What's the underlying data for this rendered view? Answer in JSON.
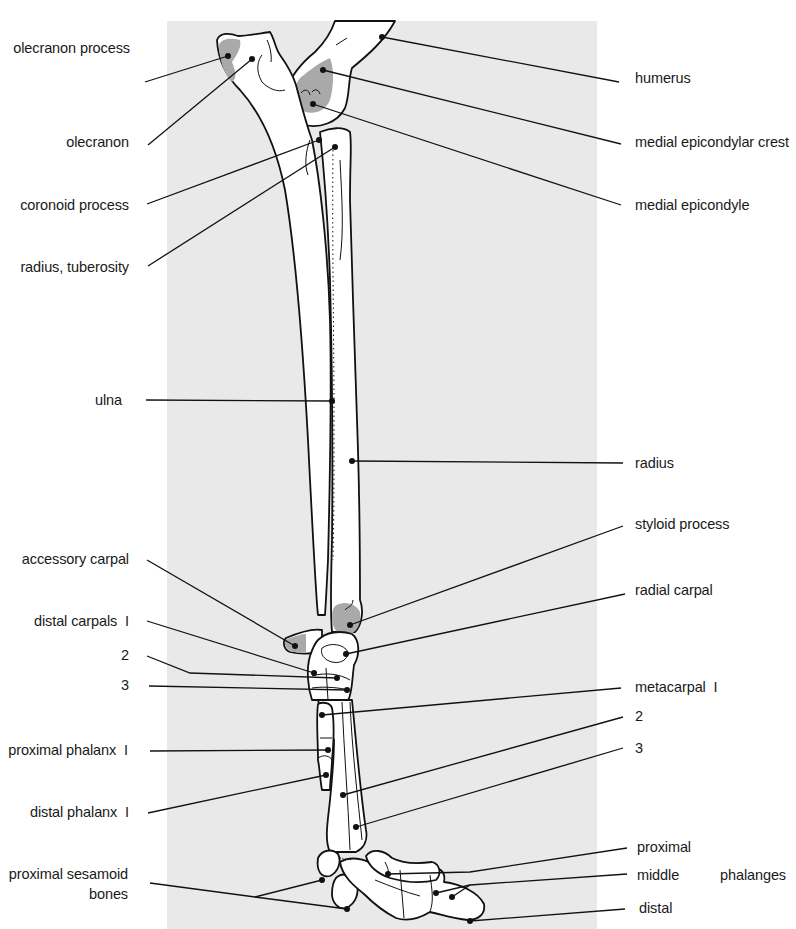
{
  "diagram": {
    "colors": {
      "background_panel": "#e9e9e9",
      "bone_fill": "#ffffff",
      "shaded_region": "#a9a9a9",
      "outline": "#111111"
    },
    "labels_left": [
      {
        "id": "olecranon-process",
        "text": "olecranon process",
        "x": 5,
        "y": 40,
        "w": 125
      },
      {
        "id": "olecranon",
        "text": "olecranon",
        "x": 5,
        "y": 134,
        "w": 124
      },
      {
        "id": "coronoid-process",
        "text": "coronoid process",
        "x": 5,
        "y": 197,
        "w": 124
      },
      {
        "id": "radius-tuberosity",
        "text": "radius, tuberosity",
        "x": 5,
        "y": 259,
        "w": 124
      },
      {
        "id": "ulna",
        "text": "ulna",
        "x": 5,
        "y": 392,
        "w": 117
      },
      {
        "id": "accessory-carpal",
        "text": "accessory carpal",
        "x": 5,
        "y": 551,
        "w": 124
      },
      {
        "id": "distal-carpals-1",
        "text": "distal carpals  I",
        "x": 5,
        "y": 613,
        "w": 124
      },
      {
        "id": "distal-carpals-2",
        "text": "2",
        "x": 5,
        "y": 647,
        "w": 124
      },
      {
        "id": "distal-carpals-3",
        "text": "3",
        "x": 5,
        "y": 677,
        "w": 124
      },
      {
        "id": "proximal-phalanx-1",
        "text": "proximal phalanx  I",
        "x": 0,
        "y": 742,
        "w": 128
      },
      {
        "id": "distal-phalanx-1",
        "text": "distal phalanx  I",
        "x": 5,
        "y": 804,
        "w": 124
      },
      {
        "id": "proximal-sesamoid-bones",
        "text": "proximal sesamoid",
        "x": 0,
        "y": 866,
        "w": 128
      },
      {
        "id": "proximal-sesamoid-bones-2",
        "text": "bones",
        "x": 0,
        "y": 886,
        "w": 128
      }
    ],
    "labels_right": [
      {
        "id": "humerus",
        "text": "humerus",
        "x": 635,
        "y": 70
      },
      {
        "id": "medial-epicondylar-crest",
        "text": "medial epicondylar crest",
        "x": 635,
        "y": 134
      },
      {
        "id": "medial-epicondyle",
        "text": "medial epicondyle",
        "x": 635,
        "y": 197
      },
      {
        "id": "radius",
        "text": "radius",
        "x": 635,
        "y": 455
      },
      {
        "id": "styloid-process",
        "text": "styloid process",
        "x": 635,
        "y": 516
      },
      {
        "id": "radial-carpal",
        "text": "radial carpal",
        "x": 635,
        "y": 582
      },
      {
        "id": "metacarpal-1",
        "text": "metacarpal  I",
        "x": 635,
        "y": 679
      },
      {
        "id": "metacarpal-2",
        "text": "2",
        "x": 635,
        "y": 708
      },
      {
        "id": "metacarpal-3",
        "text": "3",
        "x": 635,
        "y": 740
      },
      {
        "id": "phalanges-proximal",
        "text": "proximal",
        "x": 637,
        "y": 839
      },
      {
        "id": "phalanges-middle",
        "text": "middle",
        "x": 637,
        "y": 867
      },
      {
        "id": "phalanges-group",
        "text": "phalanges",
        "x": 720,
        "y": 867
      },
      {
        "id": "phalanges-distal",
        "text": "distal",
        "x": 639,
        "y": 900
      }
    ],
    "leaders": [
      {
        "id": "olecranon-process",
        "x1": 145,
        "y1": 82,
        "x2": 228,
        "y2": 56
      },
      {
        "id": "olecranon",
        "x1": 148,
        "y1": 145,
        "x2": 252,
        "y2": 59
      },
      {
        "id": "coronoid-process",
        "x1": 147,
        "y1": 204,
        "x2": 319,
        "y2": 140
      },
      {
        "id": "radius-tuberosity",
        "x1": 148,
        "y1": 266,
        "x2": 335,
        "y2": 147
      },
      {
        "id": "ulna",
        "x1": 146,
        "y1": 400,
        "x2": 332,
        "y2": 401
      },
      {
        "id": "radius",
        "x1": 623,
        "y1": 463,
        "x2": 352,
        "y2": 461
      },
      {
        "id": "humerus",
        "x1": 619,
        "y1": 82,
        "x2": 382,
        "y2": 37
      },
      {
        "id": "medial-epicondylar-crest",
        "x1": 621,
        "y1": 144,
        "x2": 323,
        "y2": 70
      },
      {
        "id": "medial-epicondyle",
        "x1": 621,
        "y1": 205,
        "x2": 313,
        "y2": 104
      },
      {
        "id": "styloid-process",
        "x1": 623,
        "y1": 526,
        "x2": 350,
        "y2": 625
      },
      {
        "id": "radial-carpal",
        "x1": 625,
        "y1": 594,
        "x2": 346,
        "y2": 654
      },
      {
        "id": "accessory-carpal",
        "x1": 147,
        "y1": 560,
        "x2": 295,
        "y2": 646
      },
      {
        "id": "distal-carpals-1",
        "x1": 147,
        "y1": 621,
        "x2": 314,
        "y2": 673
      },
      {
        "id": "distal-carpals-2",
        "points": "147,656 190,673 337,678"
      },
      {
        "id": "distal-carpals-3",
        "x1": 149,
        "y1": 686,
        "x2": 347,
        "y2": 690
      },
      {
        "id": "metacarpal-1",
        "x1": 621,
        "y1": 688,
        "x2": 322,
        "y2": 715
      },
      {
        "id": "metacarpal-2",
        "x1": 623,
        "y1": 717,
        "x2": 343,
        "y2": 795
      },
      {
        "id": "metacarpal-3",
        "x1": 623,
        "y1": 748,
        "x2": 356,
        "y2": 827
      },
      {
        "id": "proximal-phalanx-1",
        "x1": 150,
        "y1": 751,
        "x2": 328,
        "y2": 750
      },
      {
        "id": "distal-phalanx-1",
        "x1": 148,
        "y1": 813,
        "x2": 326,
        "y2": 775
      },
      {
        "id": "proximal-sesamoid-a",
        "points": "150,883 255,897 322,880"
      },
      {
        "id": "proximal-sesamoid-b",
        "points": "255,897 347,909"
      },
      {
        "id": "phalanges-proximal",
        "points": "627,848 470,872 388,874"
      },
      {
        "id": "phalanges-middle-a",
        "points": "627,874 470,885 436,893"
      },
      {
        "id": "phalanges-middle-b",
        "points": "470,885 452,897"
      },
      {
        "id": "phalanges-distal",
        "x1": 625,
        "y1": 909,
        "x2": 470,
        "y2": 921
      }
    ]
  }
}
